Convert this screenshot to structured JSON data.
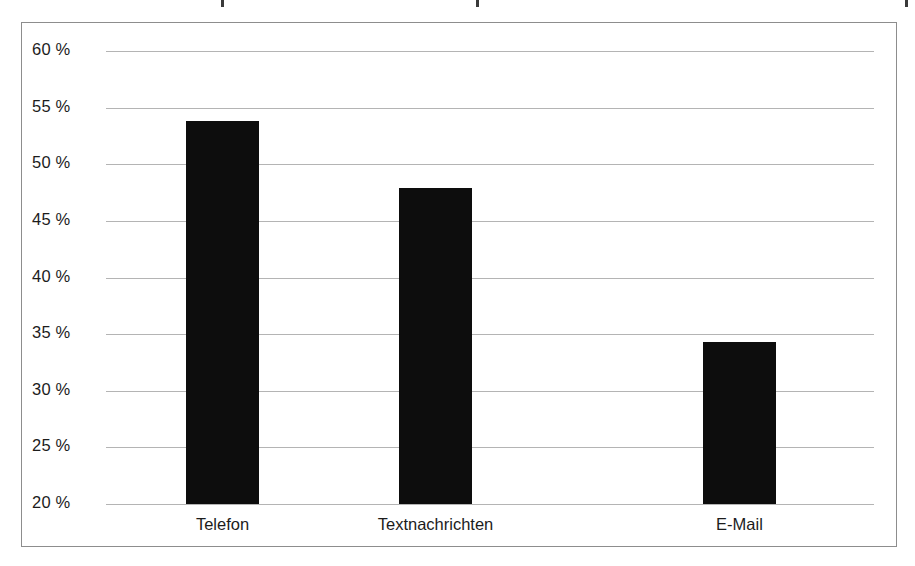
{
  "chart_data": {
    "type": "bar",
    "title": "",
    "subtitle": "",
    "xlabel": "",
    "ylabel": "",
    "categories": [
      "Telefon",
      "Textnachrichten",
      "E-Mail"
    ],
    "values": [
      53.8,
      47.9,
      34.3
    ],
    "value_unit": "%",
    "ylim": [
      20,
      60
    ],
    "yticks": [
      20,
      25,
      30,
      35,
      40,
      45,
      50,
      55,
      60
    ],
    "ytick_labels": [
      "20 %",
      "25 %",
      "30 %",
      "35 %",
      "40 %",
      "45 %",
      "50 %",
      "55 %",
      "60 %"
    ],
    "grid": true,
    "grid_axis": "y",
    "legend": false,
    "legend_position": "none",
    "bar_color": "#0d0d0d",
    "gridline_color": "#b4b4b4",
    "frame_color": "#8d8d8d",
    "background_color": "#ffffff",
    "text_color": "#1c1c1c",
    "series": [
      {
        "name": "",
        "values": [
          53.8,
          47.9,
          34.3
        ]
      }
    ]
  }
}
